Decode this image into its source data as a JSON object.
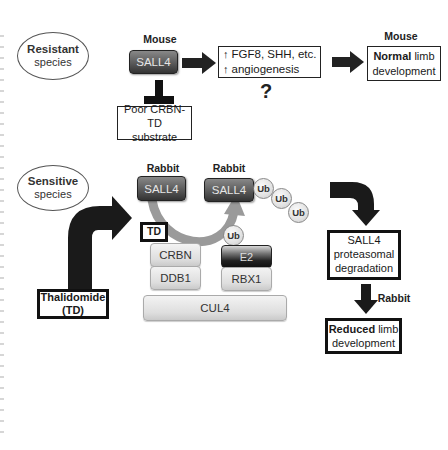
{
  "resistant": {
    "ellipse": {
      "line1": "Resistant",
      "line2": "species"
    },
    "species_label": "Mouse",
    "sall4": "SALL4",
    "inhibited_box": {
      "line1": "Poor CRBN-TD",
      "line2": "substrate"
    },
    "effects_box": {
      "line1": "FGF8, SHH, etc.",
      "line2": "angiogenesis",
      "arrow_glyph": "↑"
    },
    "question_mark": "?",
    "outcome_species_label": "Mouse",
    "outcome_box": {
      "bold": "Normal",
      "rest1": " limb",
      "line2": "development"
    }
  },
  "sensitive": {
    "ellipse": {
      "line1": "Sensitive",
      "line2": "species"
    },
    "substrate_label": "Rabbit",
    "substrate": "SALL4",
    "ubiquitinated_label": "Rabbit",
    "ubiquitinated": "SALL4",
    "ub_label": "Ub",
    "drug_box": {
      "line1": "Thalidomide",
      "line2": "(TD)"
    },
    "td_box": "TD",
    "complex": {
      "crbn": "CRBN",
      "ddb1": "DDB1",
      "e2": "E2",
      "rbx1": "RBX1",
      "cul4": "CUL4"
    },
    "degradation_box": {
      "line1": "SALL4",
      "line2": "proteasomal",
      "line3": "degradation"
    },
    "outcome_species_label": "Rabbit",
    "outcome_box": {
      "bold": "Reduced",
      "rest1": " limb",
      "line2": "development"
    }
  },
  "colors": {
    "arrow": "#1e1e1e",
    "curved_arrow": "#9a9a9a",
    "box_border": "#111111",
    "sall4_dark": "#333333"
  }
}
